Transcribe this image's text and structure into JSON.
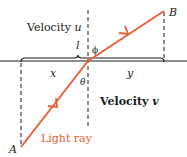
{
  "labels": {
    "velocity_top": "Velocity ",
    "velocity_top_var": "u",
    "velocity_bottom": "Velocity ",
    "velocity_bottom_var": "v",
    "point_a": "A",
    "point_b": "B",
    "segment_x": "x",
    "segment_y": "y",
    "length_l": "l",
    "angle_phi": "ϕ",
    "angle_theta": "θ",
    "ray_label": "Light ray"
  },
  "colors": {
    "ray": "#e8603a",
    "line": "#1a1a1a"
  }
}
